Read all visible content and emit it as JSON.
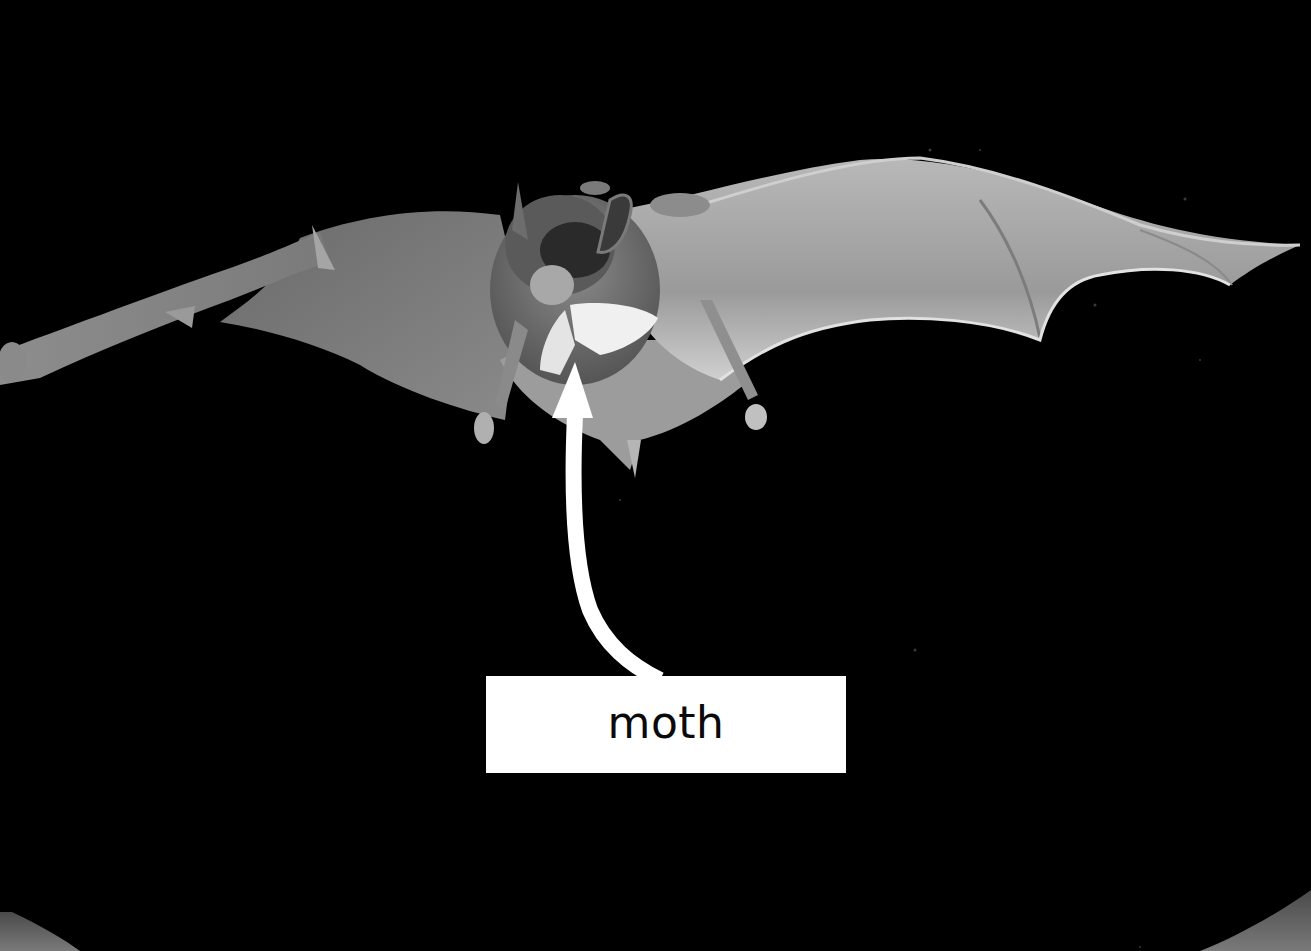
{
  "image": {
    "subject": "bat in flight carrying a moth",
    "background_color": "#000000",
    "tone": "grayscale"
  },
  "annotation": {
    "label": "moth",
    "label_box_color": "#ffffff",
    "label_text_color": "#0a0a0a",
    "arrow_color": "#ffffff",
    "arrow_target": "moth"
  },
  "frame": {
    "corner_color": "#5a5a5a"
  }
}
